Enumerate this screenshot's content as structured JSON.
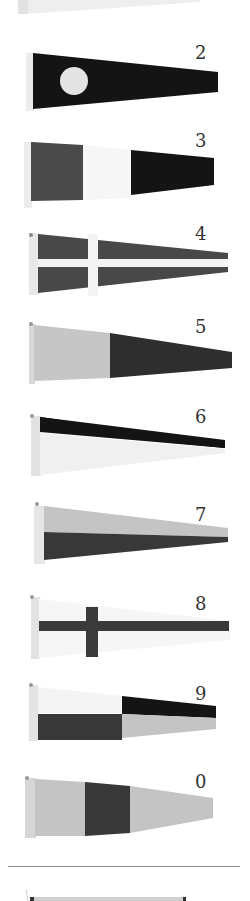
{
  "colors": {
    "black": "#141414",
    "dark": "#3c3c3c",
    "mid": "#5a5a5a",
    "light": "#c8c8c8",
    "white": "#f4f4f4",
    "hoist": "#e6e6e6",
    "divider": "#8a8a8a"
  },
  "pennants": [
    {
      "numeral": "1",
      "partial": true,
      "design": "white with circle (cropped at top)"
    },
    {
      "numeral": "2",
      "design": "dark with light circle"
    },
    {
      "numeral": "3",
      "design": "vertical tricolor: dark, white, black"
    },
    {
      "numeral": "4",
      "design": "dark with white cross"
    },
    {
      "numeral": "5",
      "design": "vertical bicolor: light, dark"
    },
    {
      "numeral": "6",
      "design": "horizontal bicolor: black over white"
    },
    {
      "numeral": "7",
      "design": "horizontal bicolor: light over dark"
    },
    {
      "numeral": "8",
      "design": "white with dark cross"
    },
    {
      "numeral": "9",
      "design": "quartered: white/black over dark/light"
    },
    {
      "numeral": "0",
      "design": "vertical tricolor: light, dark, light"
    }
  ],
  "footer": {
    "partial_pennant": "cropped pennant below divider"
  }
}
